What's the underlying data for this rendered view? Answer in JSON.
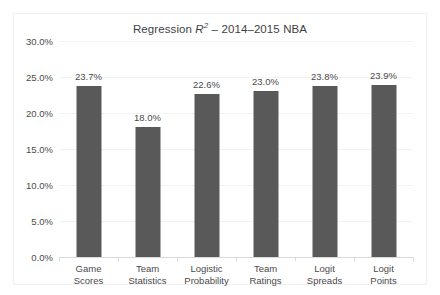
{
  "chart_data": {
    "type": "bar",
    "title_parts": {
      "lead": "Regression ",
      "italic_symbol": "R",
      "superscript": "2",
      "trail": " – 2014–2015 NBA"
    },
    "categories": [
      "Game Scores",
      "Team Statistics",
      "Logistic Probability",
      "Team Ratings",
      "Logit Spreads",
      "Logit Points"
    ],
    "category_lines": [
      [
        "Game",
        "Scores"
      ],
      [
        "Team",
        "Statistics"
      ],
      [
        "Logistic",
        "Probability"
      ],
      [
        "Team",
        "Ratings"
      ],
      [
        "Logit",
        "Spreads"
      ],
      [
        "Logit",
        "Points"
      ]
    ],
    "values": [
      23.7,
      18.0,
      22.6,
      23.0,
      23.8,
      23.9
    ],
    "value_labels": [
      "23.7%",
      "18.0%",
      "22.6%",
      "23.0%",
      "23.8%",
      "23.9%"
    ],
    "xlabel": "",
    "ylabel": "",
    "ylim": [
      0,
      30
    ],
    "ytick_values": [
      0,
      5,
      10,
      15,
      20,
      25,
      30
    ],
    "ytick_labels": [
      "0.0%",
      "5.0%",
      "10.0%",
      "15.0%",
      "20.0%",
      "25.0%",
      "30.0%"
    ],
    "grid": true,
    "legend": false,
    "bar_color": "#595959",
    "gridline_color": "#f2f2f2",
    "axis_color": "#d9d9d9",
    "border_color": "#f0f0f0",
    "text_color": "#4a4a4a",
    "background": "#ffffff"
  }
}
